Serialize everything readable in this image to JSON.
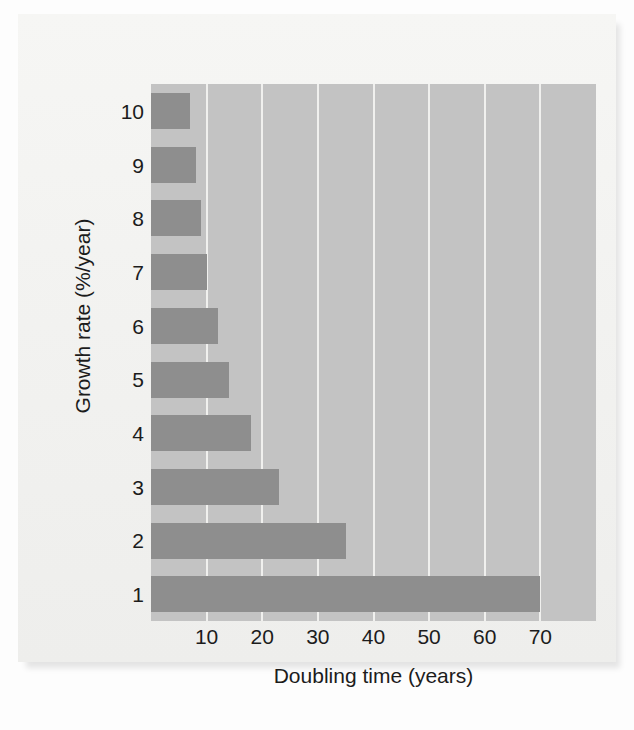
{
  "chart_data": {
    "type": "bar",
    "orientation": "horizontal",
    "title": "",
    "xlabel": "Doubling time (years)",
    "ylabel": "Growth rate (%/year)",
    "categories": [
      "10",
      "9",
      "8",
      "7",
      "6",
      "5",
      "4",
      "3",
      "2",
      "1"
    ],
    "values": [
      7,
      8,
      9,
      10,
      12,
      14,
      18,
      23,
      35,
      70
    ],
    "xlim": [
      0,
      80
    ],
    "xticks": [
      10,
      20,
      30,
      40,
      50,
      60,
      70
    ],
    "xtick_labels": [
      "10",
      "20",
      "30",
      "40",
      "50",
      "60",
      "70"
    ],
    "ytick_labels": [
      "10",
      "9",
      "8",
      "7",
      "6",
      "5",
      "4",
      "3",
      "2",
      "1"
    ],
    "grid": "vertical",
    "legend": "none",
    "bar_color": "#8e8e8e",
    "plot_background": "#c3c3c3",
    "gridline_color": "#f0f0ee",
    "figure_background": "#f2f2f0",
    "text_color": "#1c1c1c"
  }
}
